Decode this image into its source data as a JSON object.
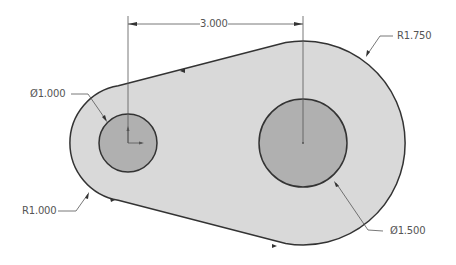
{
  "drawing": {
    "colors": {
      "body_fill": "#d9d9d9",
      "hole_fill": "#b0b0b0",
      "outline": "#333333",
      "dimension": "#555555",
      "background": "#ffffff"
    },
    "dimensions": {
      "center_distance": "3.000",
      "small_hole_diameter": "Ø1.000",
      "large_hole_diameter": "Ø1.500",
      "small_radius": "R1.000",
      "large_radius": "R1.750"
    }
  }
}
